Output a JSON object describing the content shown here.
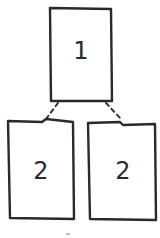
{
  "diagram": {
    "type": "tree",
    "nodes": [
      {
        "id": "top",
        "label": "1"
      },
      {
        "id": "left",
        "label": "2"
      },
      {
        "id": "right",
        "label": "2"
      }
    ],
    "edges": [
      {
        "from": "top",
        "to": "left",
        "style": "dashed"
      },
      {
        "from": "top",
        "to": "right",
        "style": "dashed"
      }
    ],
    "colors": {
      "stroke": "#2a2a2a",
      "background": "#ffffff"
    }
  }
}
